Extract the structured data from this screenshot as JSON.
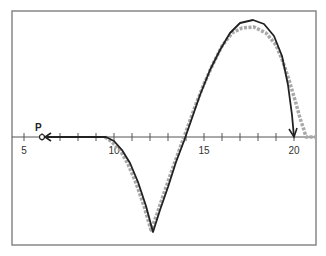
{
  "figure": {
    "frame": {
      "x": 12,
      "y": 11,
      "width": 304,
      "height": 234,
      "color": "#888888"
    },
    "axis": {
      "y": 137,
      "x_start": 12,
      "x_end": 316,
      "origin_value": 5,
      "origin_px": 24,
      "px_per_unit": 18,
      "ticks": [
        5,
        6,
        7,
        8,
        9,
        10,
        11,
        12,
        13,
        14,
        15,
        16,
        17,
        18,
        19,
        20
      ],
      "tick_labels": [
        {
          "value": 5,
          "text": "5"
        },
        {
          "value": 10,
          "text": "10"
        },
        {
          "value": 15,
          "text": "15"
        },
        {
          "value": 20,
          "text": "20"
        }
      ],
      "color": "#555555"
    },
    "point_label": {
      "text": "P",
      "value": 6
    },
    "colors": {
      "black_curve": "#222222",
      "gray_curve": "#a8a8a8"
    },
    "black_curve_points": [
      [
        42,
        137
      ],
      [
        106,
        137
      ],
      [
        114,
        141
      ],
      [
        122,
        150
      ],
      [
        130,
        163
      ],
      [
        138,
        182
      ],
      [
        146,
        206
      ],
      [
        153,
        232
      ],
      [
        160,
        210
      ],
      [
        168,
        187
      ],
      [
        176,
        162
      ],
      [
        184,
        141
      ],
      [
        192,
        118
      ],
      [
        200,
        95
      ],
      [
        210,
        70
      ],
      [
        220,
        50
      ],
      [
        230,
        33
      ],
      [
        240,
        23
      ],
      [
        253,
        20
      ],
      [
        264,
        24
      ],
      [
        274,
        36
      ],
      [
        282,
        56
      ],
      [
        288,
        85
      ],
      [
        292,
        115
      ],
      [
        294,
        137
      ]
    ],
    "gray_curve_points": [
      [
        105,
        137
      ],
      [
        112,
        142
      ],
      [
        120,
        150
      ],
      [
        128,
        164
      ],
      [
        136,
        183
      ],
      [
        144,
        206
      ],
      [
        151,
        230
      ],
      [
        157,
        214
      ],
      [
        164,
        193
      ],
      [
        172,
        170
      ],
      [
        180,
        148
      ],
      [
        188,
        126
      ],
      [
        196,
        104
      ],
      [
        204,
        84
      ],
      [
        212,
        66
      ],
      [
        222,
        46
      ],
      [
        232,
        33
      ],
      [
        242,
        28
      ],
      [
        254,
        27
      ],
      [
        266,
        33
      ],
      [
        276,
        45
      ],
      [
        283,
        62
      ],
      [
        289,
        80
      ],
      [
        295,
        100
      ],
      [
        300,
        118
      ],
      [
        304,
        130
      ],
      [
        306,
        137
      ],
      [
        316,
        137
      ]
    ]
  }
}
